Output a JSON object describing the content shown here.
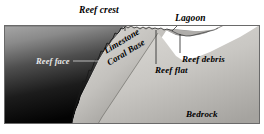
{
  "figure": {
    "kind": "geological-cross-section",
    "frame": {
      "x": 4,
      "y": 25,
      "width": 256,
      "height": 99
    }
  },
  "labels": {
    "reef_crest": "Reef crest",
    "lagoon": "Lagoon",
    "reef_face": "Reef face",
    "limestone": "Limestone",
    "coral_base": "Coral Base",
    "reef_debris": "Reef debris",
    "reef_flat": "Reef flat",
    "bedrock": "Bedrock"
  },
  "colors": {
    "water_top": "#9b9b9b",
    "water_bottom": "#050505",
    "coral_base_light": "#d3d1cd",
    "coral_base_dark": "#8e8c88",
    "bedrock_light": "#d8d6d2",
    "bedrock_dark": "#a3a19d",
    "lagoon_water": "#8f8f8f",
    "outline": "#5a5a5a",
    "leader_line": "#2a2a2a",
    "label_dark": "#000000",
    "label_light": "#e8e8e8",
    "page_background": "#ffffff"
  },
  "geometry": {
    "water_surface_y": 26,
    "reef_crest_x": 125,
    "bedrock_top_right": {
      "x": 258,
      "y": 26
    },
    "bedrock_toe": {
      "x": 72,
      "y": 123
    }
  },
  "leaders": [
    {
      "name": "reef-crest-leader",
      "x1": 125,
      "y1": 15,
      "x2": 125,
      "y2": 31
    },
    {
      "name": "reef-face-leader",
      "x1": 73,
      "y1": 61,
      "x2": 99,
      "y2": 61
    },
    {
      "name": "lagoon-leader",
      "x1": 178,
      "y1": 23,
      "x2": 170,
      "y2": 30
    },
    {
      "name": "reef-debris-leader",
      "x1": 180,
      "y1": 52,
      "x2": 180,
      "y2": 33
    },
    {
      "name": "reef-flat-leader",
      "x1": 156,
      "y1": 64,
      "x2": 156,
      "y2": 30
    }
  ]
}
